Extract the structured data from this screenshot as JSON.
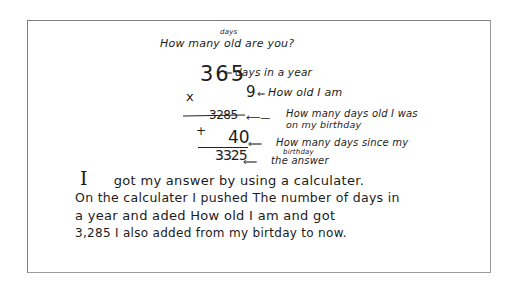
{
  "document": {
    "title_prefix": "How many",
    "title_insert": "days",
    "title_suffix": "old are you?",
    "title_full": "How many days old are you?",
    "calculation": {
      "days_in_year": "365",
      "days_in_year_label": "days in a year",
      "operator_multiply": "x",
      "age": "9",
      "age_label": "How old I am",
      "product": "3285",
      "product_label_line1": "How many days old I was",
      "product_label_line2": "on my birthday",
      "operator_add": "+",
      "days_since_birthday": "40",
      "days_since_label_line1": "How many days since my",
      "days_since_label_line2": "birthday",
      "answer": "3325",
      "answer_label": "the answer"
    },
    "explanation": {
      "line1_pronoun": "I",
      "line1": "got my answer by using a calculater.",
      "line2": "On the calculater I pushed The number of days in",
      "line3": "a year and aded How old I am and got",
      "line4": "3,285 I also added from my birtday to now."
    }
  }
}
